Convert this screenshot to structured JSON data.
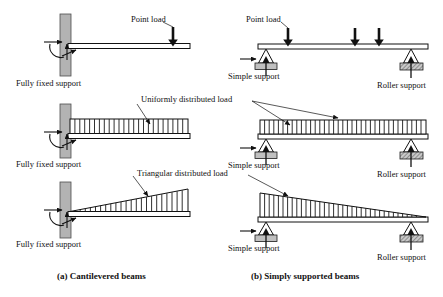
{
  "figure": {
    "title_a": "(a) Cantilevered beams",
    "title_b": "(b) Simply supported beams"
  },
  "colors": {
    "wall_fill": "#b3b3b3",
    "wall_stroke": "#4d4d4d",
    "support_fill": "#c0c0c0",
    "support_stroke": "#1a1a1a",
    "beam_stroke": "#111111",
    "hatch_stroke": "#1a1a1a",
    "arrow_fill": "#111111",
    "text": "#111111",
    "leader_stroke": "#111111"
  },
  "cantilever": {
    "support_label": "Fully fixed support",
    "rows": [
      {
        "id": "cantilever-point-load",
        "load_label": "Point load",
        "load_type": "point"
      },
      {
        "id": "cantilever-udl",
        "load_label": "Uniformly distributed load",
        "load_type": "uniform"
      },
      {
        "id": "cantilever-triangular",
        "load_label": "Triangular distributed load",
        "load_type": "triangular"
      }
    ],
    "support_labels": [
      "Fully fixed support",
      "Fully fixed support",
      "Fully fixed support"
    ]
  },
  "simply_supported": {
    "left_support_label": "Simple support",
    "right_support_label": "Roller support",
    "rows": [
      {
        "id": "simple-point-load",
        "load_label": "Point load",
        "load_type": "point",
        "point_loads": 3,
        "left_label": "Simple support",
        "right_label": "Roller support"
      },
      {
        "id": "simple-udl",
        "load_label": "Uniformly distributed load",
        "load_type": "uniform",
        "left_label": "Simple support",
        "right_label": "Roller support"
      },
      {
        "id": "simple-triangular",
        "load_label": "Triangular distributed load",
        "load_type": "triangular",
        "left_label": "Simple support",
        "right_label": "Roller support"
      }
    ]
  },
  "labels": {
    "point_load": "Point load",
    "uniformly_distributed_load": "Uniformly distributed load",
    "triangular_distributed_load": "Triangular distributed load",
    "fully_fixed_support": "Fully fixed support",
    "simple_support": "Simple support",
    "roller_support": "Roller support"
  }
}
